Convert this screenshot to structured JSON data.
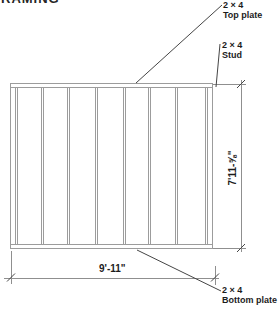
{
  "page": {
    "title_partial": "RAMING"
  },
  "diagram": {
    "labels": {
      "top_plate": {
        "size": "2 × 4",
        "name": "Top plate"
      },
      "stud": {
        "size": "2 × 4",
        "name": "Stud"
      },
      "bottom_plate": {
        "size": "2 × 4",
        "name": "Bottom plate"
      }
    },
    "dimensions": {
      "width_label": "9'-11\"",
      "height_label": "7'11-⅝\""
    },
    "structure": {
      "stud_count": 8,
      "stud_lefts": [
        4,
        30,
        56,
        84,
        112,
        137,
        164,
        194
      ]
    },
    "colors": {
      "frame_line": "#9c9c9c",
      "dim_line": "#8f8f8f",
      "leader_line": "#454545",
      "text_color": "#1c1c1c"
    }
  }
}
